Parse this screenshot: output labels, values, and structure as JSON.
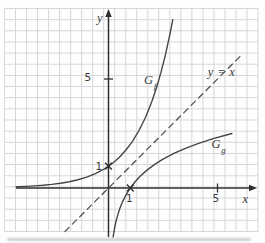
{
  "figure": {
    "background": "#fefefe",
    "grid_color": "#d7d7db",
    "axis_color": "#2f2f2f",
    "curve_color": "#454545",
    "dash_color": "#4a4a4a",
    "label_color": "#3a3a3a"
  },
  "labels": {
    "y_axis": "y",
    "x_axis": "x",
    "y_tick_5": "5",
    "y_tick_1": "1",
    "x_tick_1": "1",
    "x_tick_5": "5",
    "gf_main": "G",
    "gf_sub": "f",
    "gg_main": "G",
    "gg_sub": "g",
    "identity": "y = x"
  },
  "chart_data": {
    "type": "line",
    "title": "",
    "xlabel": "x",
    "ylabel": "y",
    "xlim": [
      -4.8,
      6.9
    ],
    "ylim": [
      -2.5,
      8.3
    ],
    "grid": true,
    "x_ticks": [
      {
        "value": 1,
        "label": "1",
        "tick": false
      },
      {
        "value": 5,
        "label": "5",
        "tick": true
      }
    ],
    "y_ticks": [
      {
        "value": 1,
        "label": "1",
        "tick": false
      },
      {
        "value": 5,
        "label": "5",
        "tick": true
      }
    ],
    "series": [
      {
        "name": "Gf",
        "description": "exponential curve f(x) = 2^x",
        "style": "solid",
        "points": [
          [
            -4.24,
            0.053
          ],
          [
            -3.8,
            0.072
          ],
          [
            -3.4,
            0.095
          ],
          [
            -3.0,
            0.125
          ],
          [
            -2.6,
            0.165
          ],
          [
            -2.2,
            0.218
          ],
          [
            -1.8,
            0.287
          ],
          [
            -1.4,
            0.379
          ],
          [
            -1.0,
            0.5
          ],
          [
            -0.6,
            0.66
          ],
          [
            -0.2,
            0.871
          ],
          [
            0,
            1
          ],
          [
            0.2,
            1.149
          ],
          [
            0.5,
            1.414
          ],
          [
            0.8,
            1.741
          ],
          [
            1.1,
            2.143
          ],
          [
            1.4,
            2.639
          ],
          [
            1.7,
            3.249
          ],
          [
            2.0,
            4.0
          ],
          [
            2.2,
            4.595
          ],
          [
            2.4,
            5.278
          ],
          [
            2.6,
            6.063
          ],
          [
            2.8,
            6.964
          ],
          [
            2.95,
            7.727
          ]
        ]
      },
      {
        "name": "Gg",
        "description": "logarithmic curve g(x) = log2(x), inverse of f",
        "style": "solid",
        "points": [
          [
            0.21,
            -2.252
          ],
          [
            0.25,
            -2.0
          ],
          [
            0.3,
            -1.737
          ],
          [
            0.36,
            -1.474
          ],
          [
            0.43,
            -1.218
          ],
          [
            0.52,
            -0.943
          ],
          [
            0.63,
            -0.667
          ],
          [
            0.76,
            -0.396
          ],
          [
            0.9,
            -0.152
          ],
          [
            1.0,
            0
          ],
          [
            1.2,
            0.263
          ],
          [
            1.45,
            0.536
          ],
          [
            1.75,
            0.807
          ],
          [
            2.1,
            1.07
          ],
          [
            2.5,
            1.322
          ],
          [
            3.0,
            1.585
          ],
          [
            3.5,
            1.807
          ],
          [
            4.1,
            2.036
          ],
          [
            4.8,
            2.263
          ],
          [
            5.66,
            2.501
          ]
        ]
      },
      {
        "name": "y = x",
        "description": "identity line, axis of reflection between f and g",
        "style": "dashed",
        "points": [
          [
            -2.0,
            -2.0
          ],
          [
            6.1,
            6.1
          ]
        ]
      }
    ],
    "marked_points": [
      {
        "x": 0,
        "y": 1,
        "marker": "x"
      },
      {
        "x": 1,
        "y": 0,
        "marker": "x"
      }
    ]
  },
  "layout": {
    "width": 265,
    "height": 243,
    "origin_px": [
      108.5,
      188
    ],
    "unit_px": 21.8,
    "grid_px": {
      "x0": 4.5,
      "x1": 258,
      "y0": 8.5,
      "y1": 231.5,
      "cols": 23,
      "rows": 20
    },
    "x_axis_px": {
      "from": 16,
      "to": 257
    },
    "y_axis_px": {
      "from": 237,
      "to": 9
    },
    "label_positions": {
      "y-axis-label": [
        100,
        18
      ],
      "x-axis-label": [
        245.5,
        198.5
      ],
      "y-tick-5-label": [
        88,
        77
      ],
      "y-tick-1-label": [
        99,
        165.5
      ],
      "x-tick-1-label": [
        129.5,
        197.5
      ],
      "x-tick-5-label": [
        216,
        198
      ],
      "curve-f-label": [
        150,
        81
      ],
      "curve-g-label": [
        218.5,
        145
      ],
      "identity-line-label": [
        221.5,
        72
      ]
    }
  }
}
